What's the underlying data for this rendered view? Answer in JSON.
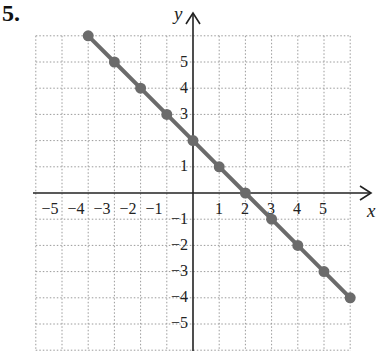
{
  "problem": {
    "number": "5."
  },
  "chart_data": {
    "type": "line",
    "title": "",
    "xlabel": "x",
    "ylabel": "y",
    "xlim": [
      -6,
      6
    ],
    "ylim": [
      -6,
      6
    ],
    "grid": true,
    "grid_style": "dotted",
    "x_tick_labels": [
      "-5",
      "-4",
      "-3",
      "-2",
      "-1",
      "1",
      "2",
      "3",
      "4",
      "5"
    ],
    "y_tick_labels": [
      "5",
      "4",
      "3",
      "1",
      "-1",
      "-2",
      "-3",
      "-4",
      "-5"
    ],
    "series": [
      {
        "name": "y = -x + 2",
        "color": "#6b6b6b",
        "x": [
          -4,
          -3,
          -2,
          -1,
          0,
          1,
          2,
          3,
          4,
          5,
          6
        ],
        "y": [
          6,
          5,
          4,
          3,
          2,
          1,
          0,
          -1,
          -2,
          -3,
          -4
        ]
      }
    ]
  },
  "labels": {
    "x_axis": "x",
    "y_axis": "y",
    "xt": {
      "m5": "−5",
      "m4": "−4",
      "m3": "−3",
      "m2": "−2",
      "m1": "−1",
      "p1": "1",
      "p2": "2",
      "p3": "3",
      "p4": "4",
      "p5": "5"
    },
    "yt": {
      "p5": "5",
      "p4": "4",
      "p3": "3",
      "p1": "1",
      "m1": "−1",
      "m2": "−2",
      "m3": "−3",
      "m4": "−4",
      "m5": "−5"
    }
  }
}
